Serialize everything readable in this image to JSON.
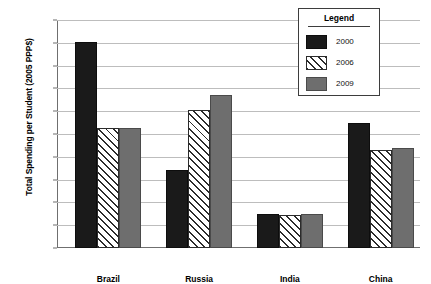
{
  "chart_data": {
    "type": "bar",
    "title": "",
    "xlabel": "",
    "ylabel": "Total Spending per Student (2005 PPP$)",
    "categories": [
      "Brazil",
      "Russia",
      "India",
      "China"
    ],
    "series": [
      {
        "name": "2000",
        "style": "solid-black",
        "color": "#1a1a1a",
        "values": [
          9050,
          3400,
          1500,
          5500
        ]
      },
      {
        "name": "2006",
        "style": "diagonal-hatch",
        "color": "#ffffff",
        "values": [
          5250,
          6050,
          1450,
          4300
        ]
      },
      {
        "name": "2009",
        "style": "solid-gray",
        "color": "#6e6e6e",
        "values": [
          5250,
          6700,
          1480,
          4400
        ]
      }
    ],
    "ylim": [
      0,
      10000
    ],
    "ytick_values": [
      0,
      1000,
      2000,
      3000,
      4000,
      5000,
      6000,
      7000,
      8000,
      9000,
      10000
    ],
    "ytick_labels": [
      "0",
      "1,000",
      "2,000",
      "3,000",
      "4,000",
      "5,000",
      "6,000",
      "7,000",
      "8,000",
      "9,000",
      "10,000"
    ],
    "grid": true,
    "legend_position": "top-right",
    "legend_title": "Legend"
  }
}
